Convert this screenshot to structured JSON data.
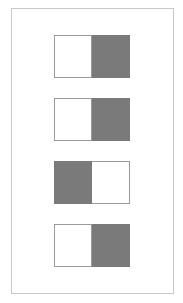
{
  "diagram": {
    "colors": {
      "filled": "#7a7a7a",
      "empty": "#ffffff",
      "border": "#9a9a9a",
      "frame": "#c8c8c8"
    },
    "pairs": [
      {
        "cells": [
          "empty",
          "filled"
        ]
      },
      {
        "cells": [
          "empty",
          "filled"
        ]
      },
      {
        "cells": [
          "filled",
          "empty"
        ]
      },
      {
        "cells": [
          "empty",
          "filled"
        ]
      }
    ]
  }
}
